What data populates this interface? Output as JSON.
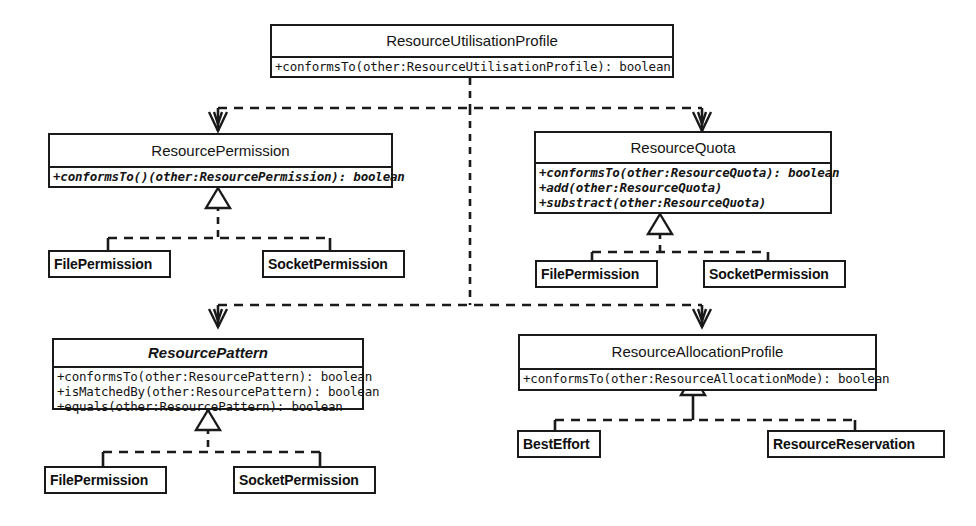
{
  "diagram": {
    "kind": "uml-class-diagram",
    "background": "#ffffff",
    "line_color": "#1a1a1a",
    "width": 976,
    "height": 526
  },
  "classes": {
    "resource_utilisation_profile": {
      "name": "ResourceUtilisationProfile",
      "abstract": false,
      "operations": [
        "+conformsTo(other:ResourceUtilisationProfile): boolean"
      ]
    },
    "resource_permission": {
      "name": "ResourcePermission",
      "abstract": false,
      "operations": [
        "+conformsTo()(other:ResourcePermission): boolean"
      ]
    },
    "resource_quota": {
      "name": "ResourceQuota",
      "abstract": false,
      "operations": [
        "+conformsTo(other:ResourceQuota): boolean",
        "+add(other:ResourceQuota)",
        "+substract(other:ResourceQuota)"
      ]
    },
    "resource_pattern": {
      "name": "ResourcePattern",
      "abstract": true,
      "operations": [
        "+conformsTo(other:ResourcePattern): boolean",
        "+isMatchedBy(other:ResourcePattern): boolean",
        "+equals(other:ResourcePattern): boolean"
      ]
    },
    "resource_allocation_profile": {
      "name": "ResourceAllocationProfile",
      "abstract": false,
      "operations": [
        "+conformsTo(other:ResourceAllocationMode): boolean"
      ]
    }
  },
  "leaf_classes": {
    "permission_file": "FilePermission",
    "permission_socket": "SocketPermission",
    "quota_file": "FilePermission",
    "quota_socket": "SocketPermission",
    "pattern_file": "FilePermission",
    "pattern_socket": "SocketPermission",
    "allocation_best_effort": "BestEffort",
    "allocation_reservation": "ResourceReservation"
  },
  "relations": {
    "dependency_style": "dashed-open-arrow",
    "generalization_style": "dashed-hollow-triangle"
  }
}
